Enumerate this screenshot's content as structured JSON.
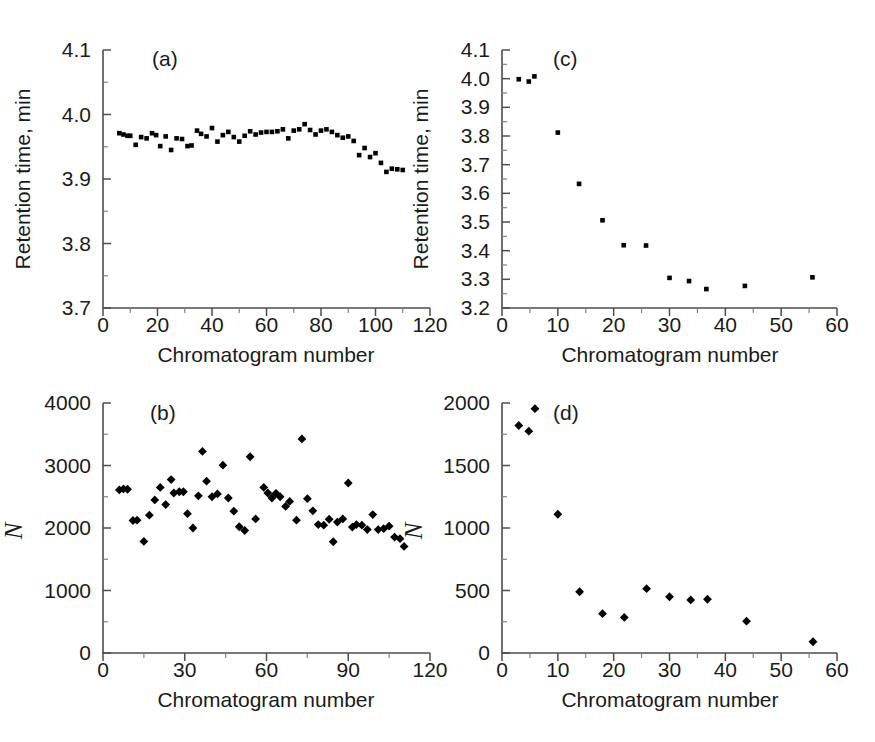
{
  "figure": {
    "panels": [
      "a",
      "b",
      "c",
      "d"
    ],
    "shared_xlabel": "Chromatogram number",
    "background": "#ffffff",
    "marker_color": "#000000",
    "axis_color": "#4d4d4d"
  },
  "chart_data": [
    {
      "id": "a",
      "type": "scatter",
      "title": "(a)",
      "xlabel": "Chromatogram number",
      "ylabel": "Retention time, min",
      "xlim": [
        0,
        120
      ],
      "ylim": [
        3.7,
        4.1
      ],
      "xticks": [
        0,
        20,
        40,
        60,
        80,
        100,
        120
      ],
      "yticks": [
        3.7,
        3.8,
        3.9,
        4.0,
        4.1
      ],
      "xticklabels": [
        "0",
        "20",
        "40",
        "60",
        "80",
        "100",
        "120"
      ],
      "yticklabels": [
        "3.7",
        "3.8",
        "3.9",
        "4.0",
        "4.1"
      ],
      "x_minor_step": 10,
      "y_minor_step": 0.05,
      "marker": "square",
      "grid": false,
      "legend": false,
      "x": [
        6,
        7.5,
        9,
        10,
        12,
        14,
        16,
        18,
        19.5,
        21,
        23,
        25,
        27,
        29,
        31,
        32.5,
        34.5,
        36,
        38,
        40,
        42,
        44,
        46,
        48,
        50,
        52,
        54,
        56,
        58,
        60,
        62,
        64,
        66,
        68,
        70,
        72,
        74,
        76,
        78,
        80,
        82,
        84,
        86,
        88,
        90,
        92,
        94,
        96,
        98,
        100,
        102,
        104,
        106,
        108,
        110
      ],
      "y": [
        3.971,
        3.969,
        3.967,
        3.967,
        3.953,
        3.965,
        3.963,
        3.971,
        3.968,
        3.951,
        3.966,
        3.945,
        3.963,
        3.962,
        3.951,
        3.952,
        3.975,
        3.97,
        3.966,
        3.979,
        3.958,
        3.968,
        3.973,
        3.965,
        3.958,
        3.967,
        3.974,
        3.969,
        3.972,
        3.973,
        3.973,
        3.974,
        3.977,
        3.963,
        3.975,
        3.977,
        3.985,
        3.976,
        3.969,
        3.975,
        3.977,
        3.973,
        3.968,
        3.964,
        3.966,
        3.959,
        3.937,
        3.948,
        3.934,
        3.94,
        3.925,
        3.911,
        3.916,
        3.915,
        3.914
      ]
    },
    {
      "id": "b",
      "type": "scatter",
      "title": "(b)",
      "xlabel": "Chromatogram number",
      "ylabel": "N",
      "xlim": [
        0,
        120
      ],
      "ylim": [
        0,
        4000
      ],
      "xticks": [
        0,
        30,
        60,
        90,
        120
      ],
      "yticks": [
        0,
        1000,
        2000,
        3000,
        4000
      ],
      "xticklabels": [
        "0",
        "30",
        "60",
        "90",
        "120"
      ],
      "yticklabels": [
        "0",
        "1000",
        "2000",
        "3000",
        "4000"
      ],
      "x_minor_step": 15,
      "y_minor_step": 500,
      "marker": "diamond",
      "grid": false,
      "legend": false,
      "x": [
        6,
        7.5,
        9,
        11,
        12.5,
        15,
        17,
        19,
        21,
        23,
        25,
        26,
        28,
        29.5,
        31,
        33,
        35,
        36.5,
        38,
        40,
        42,
        44,
        46,
        48,
        50,
        52,
        54,
        56,
        59,
        60.5,
        62,
        63.5,
        65,
        67,
        68.5,
        71,
        73,
        75,
        77,
        79,
        81,
        83,
        84.5,
        86,
        88,
        90,
        91.5,
        93,
        95,
        97,
        99,
        101,
        103,
        105,
        107,
        109,
        110.5
      ],
      "y": [
        2610,
        2625,
        2620,
        2120,
        2125,
        1785,
        2205,
        2450,
        2650,
        2375,
        2775,
        2560,
        2580,
        2580,
        2230,
        2000,
        2515,
        3225,
        2750,
        2500,
        2545,
        3005,
        2480,
        2270,
        2020,
        1960,
        3140,
        2145,
        2650,
        2560,
        2480,
        2555,
        2500,
        2345,
        2425,
        2125,
        3425,
        2470,
        2275,
        2055,
        2045,
        2140,
        1780,
        2095,
        2145,
        2720,
        2015,
        2055,
        2045,
        1975,
        2215,
        1975,
        1990,
        2030,
        1855,
        1830,
        1705
      ]
    },
    {
      "id": "c",
      "type": "scatter",
      "title": "(c)",
      "xlabel": "Chromatogram number",
      "ylabel": "Retention time, min",
      "xlim": [
        0,
        60
      ],
      "ylim": [
        3.2,
        4.1
      ],
      "xticks": [
        0,
        10,
        20,
        30,
        40,
        50,
        60
      ],
      "yticks": [
        3.2,
        3.3,
        3.4,
        3.5,
        3.6,
        3.7,
        3.8,
        3.9,
        4.0,
        4.1
      ],
      "xticklabels": [
        "0",
        "10",
        "20",
        "30",
        "40",
        "50",
        "60"
      ],
      "yticklabels": [
        "3.2",
        "3.3",
        "3.4",
        "3.5",
        "3.6",
        "3.7",
        "3.8",
        "3.9",
        "4.0",
        "4.1"
      ],
      "x_minor_step": 5,
      "y_minor_step": 0.05,
      "marker": "square",
      "grid": false,
      "legend": false,
      "x": [
        3.0,
        4.8,
        5.8,
        10.0,
        13.8,
        18.0,
        21.8,
        25.8,
        30.0,
        33.5,
        36.6,
        43.5,
        55.6
      ],
      "y": [
        3.998,
        3.99,
        4.008,
        3.812,
        3.633,
        3.506,
        3.419,
        3.418,
        3.305,
        3.294,
        3.266,
        3.277,
        3.307
      ]
    },
    {
      "id": "d",
      "type": "scatter",
      "title": "(d)",
      "xlabel": "Chromatogram number",
      "ylabel": "N",
      "xlim": [
        0,
        60
      ],
      "ylim": [
        0,
        2000
      ],
      "xticks": [
        0,
        10,
        20,
        30,
        40,
        50,
        60
      ],
      "yticks": [
        0,
        500,
        1000,
        1500,
        2000
      ],
      "xticklabels": [
        "0",
        "10",
        "20",
        "30",
        "40",
        "50",
        "60"
      ],
      "yticklabels": [
        "0",
        "500",
        "1000",
        "1500",
        "2000"
      ],
      "x_minor_step": 5,
      "y_minor_step": 250,
      "marker": "diamond",
      "grid": false,
      "legend": false,
      "x": [
        3.0,
        4.8,
        5.9,
        10.0,
        13.9,
        18.0,
        21.9,
        25.9,
        30.0,
        33.8,
        36.8,
        43.8,
        55.7
      ],
      "y": [
        1820,
        1775,
        1955,
        1110,
        490,
        315,
        285,
        515,
        450,
        425,
        430,
        255,
        90
      ]
    }
  ]
}
